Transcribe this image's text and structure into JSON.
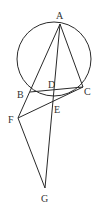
{
  "figure": {
    "caption": "",
    "stroke_color": "#2a2a2a",
    "label_color": "#333333",
    "circle": {
      "cx": 54,
      "cy": 59,
      "r": 37
    },
    "points": {
      "A": {
        "x": 60,
        "y": 24,
        "label": "A",
        "lx": 56,
        "ly": 19
      },
      "B": {
        "x": 30,
        "y": 92,
        "label": "B",
        "lx": 17,
        "ly": 98
      },
      "C": {
        "x": 83,
        "y": 87,
        "label": "C",
        "lx": 84,
        "ly": 95
      },
      "D": {
        "x": 55,
        "y": 90,
        "label": "D",
        "lx": 48,
        "ly": 88
      },
      "E": {
        "x": 53,
        "y": 101,
        "label": "E",
        "lx": 54,
        "ly": 113
      },
      "F": {
        "x": 18,
        "y": 118,
        "label": "F",
        "lx": 8,
        "ly": 123
      },
      "G": {
        "x": 45,
        "y": 188,
        "label": "G",
        "lx": 41,
        "ly": 202
      }
    },
    "segments": [
      [
        "A",
        "F"
      ],
      [
        "A",
        "G"
      ],
      [
        "A",
        "C"
      ],
      [
        "B",
        "C"
      ],
      [
        "F",
        "C"
      ],
      [
        "F",
        "G"
      ]
    ]
  }
}
